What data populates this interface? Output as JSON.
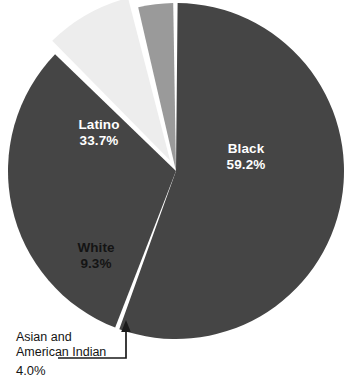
{
  "chart_data": {
    "type": "pie",
    "title": "",
    "subtitle": "",
    "xlabel": "",
    "ylabel": "",
    "legend_position": "none",
    "grid": false,
    "labels_inside_slices": true,
    "categories": [
      "Black",
      "Latino",
      "White",
      "Asian and American Indian"
    ],
    "values": [
      59.2,
      33.7,
      9.3,
      4.0
    ],
    "value_suffix": "%",
    "slices": [
      {
        "name": "Black",
        "value": 59.2,
        "value_text": "59.2%",
        "color": "#454545",
        "label_color": "#ffffff",
        "exploded": false,
        "callout": false
      },
      {
        "name": "Latino",
        "value": 33.7,
        "value_text": "33.7%",
        "color": "#454545",
        "label_color": "#ffffff",
        "exploded": false,
        "callout": false
      },
      {
        "name": "White",
        "value": 9.3,
        "value_text": "9.3%",
        "color": "#ededed",
        "label_color": "#141414",
        "exploded": true,
        "callout": false
      },
      {
        "name": "Asian and American Indian",
        "value": 4.0,
        "value_text": "4.0%",
        "color": "#9a9a9a",
        "label_color": "#141414",
        "exploded": false,
        "callout": true
      }
    ]
  },
  "labels": {
    "black": {
      "name": "Black",
      "value": "59.2%"
    },
    "latino": {
      "name": "Latino",
      "value": "33.7%"
    },
    "white": {
      "name": "White",
      "value": "9.3%"
    },
    "asian": {
      "line1": "Asian and",
      "line2": "American Indian",
      "value": "4.0%"
    }
  },
  "colors": {
    "background": "#ffffff",
    "dark_slice": "#454545",
    "light_slice": "#ededed",
    "mid_slice": "#9a9a9a",
    "callout_line": "#1a1a1a",
    "gap": "#ffffff"
  }
}
